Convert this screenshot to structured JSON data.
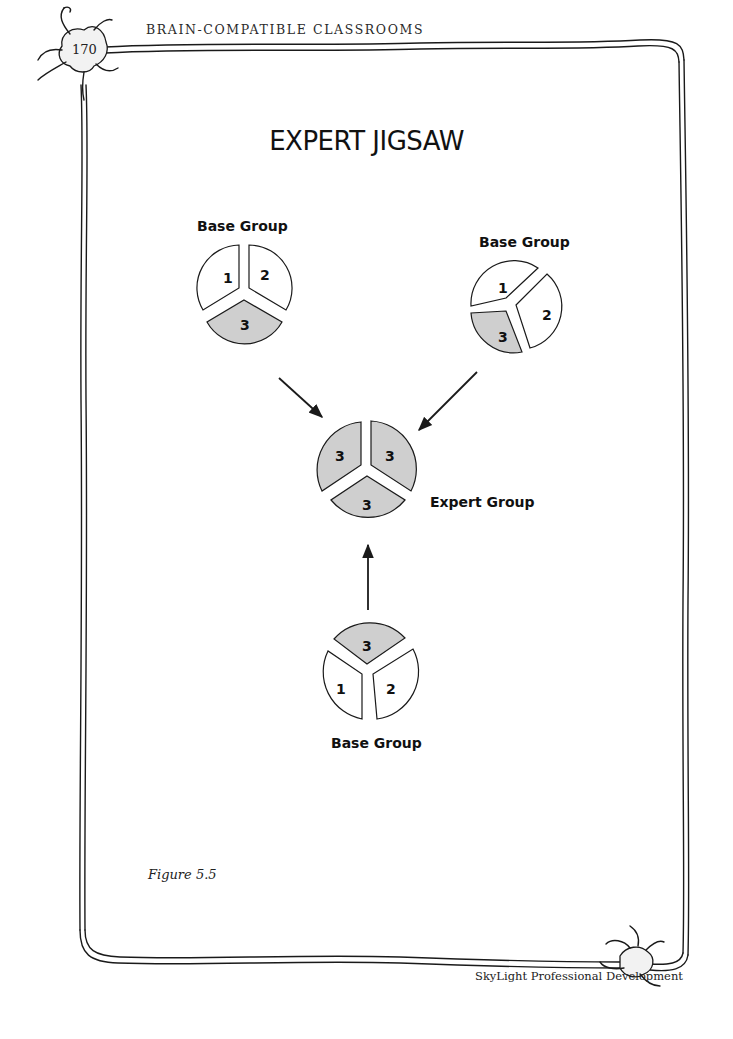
{
  "header": {
    "running_head": "BRAIN-COMPATIBLE CLASSROOMS",
    "page_number": "170"
  },
  "figure": {
    "title": "EXPERT JIGSAW",
    "caption": "Figure 5.5",
    "colors": {
      "segment_highlight": "#cfcfcf",
      "segment_plain": "#ffffff",
      "stroke": "#1a1a1a"
    },
    "groups": [
      {
        "id": "base-group-top-left",
        "label": "Base Group",
        "segments": [
          {
            "number": "1",
            "highlighted": false
          },
          {
            "number": "2",
            "highlighted": false
          },
          {
            "number": "3",
            "highlighted": true
          }
        ]
      },
      {
        "id": "base-group-top-right",
        "label": "Base Group",
        "segments": [
          {
            "number": "1",
            "highlighted": false
          },
          {
            "number": "2",
            "highlighted": false
          },
          {
            "number": "3",
            "highlighted": true
          }
        ]
      },
      {
        "id": "expert-group",
        "label": "Expert Group",
        "segments": [
          {
            "number": "3",
            "highlighted": true
          },
          {
            "number": "3",
            "highlighted": true
          },
          {
            "number": "3",
            "highlighted": true
          }
        ]
      },
      {
        "id": "base-group-bottom",
        "label": "Base Group",
        "segments": [
          {
            "number": "3",
            "highlighted": true
          },
          {
            "number": "1",
            "highlighted": false
          },
          {
            "number": "2",
            "highlighted": false
          }
        ]
      }
    ],
    "arrows": [
      {
        "from": "base-group-top-left",
        "to": "expert-group"
      },
      {
        "from": "base-group-top-right",
        "to": "expert-group"
      },
      {
        "from": "base-group-bottom",
        "to": "expert-group"
      }
    ]
  },
  "footer": {
    "publisher": "SkyLight Professional Development"
  }
}
